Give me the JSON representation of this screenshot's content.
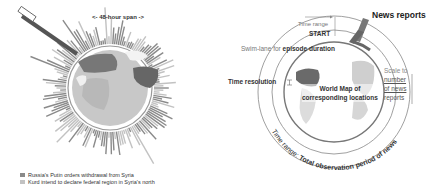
{
  "left_figure": {
    "span_label": "<- 48-hour span ->",
    "legend": [
      {
        "label": "Russia's Putin orders withdrawal from Syria",
        "color": "#8a8a8a"
      },
      {
        "label": "Kurd intend to declare federal region in Syria's north",
        "color": "#c2c2c2"
      }
    ]
  },
  "right_figure": {
    "labels": {
      "news_reports": "News reports",
      "time_range": "Time range",
      "start": "START",
      "swim_lane_prefix": "Swim-lane for",
      "swim_lane_bold": "episode duration",
      "time_resolution": "Time resolution",
      "world_map_line1": "World Map of",
      "world_map_line2": "corresponding locations",
      "scale_line1": "Scale to",
      "scale_line2": "number",
      "scale_line3": "of news",
      "scale_line4": "reports",
      "time_range_arc_prefix": "Time range:",
      "time_range_arc_bold": "Total observation period of news"
    }
  },
  "colors": {
    "bar_dark": "#8a8a8a",
    "bar_light": "#c2c2c2",
    "globe_ocean": "#d8d8d8",
    "land_dark": "#6e6e6e",
    "land_mid": "#a8a8a8",
    "ring": "#777777"
  }
}
